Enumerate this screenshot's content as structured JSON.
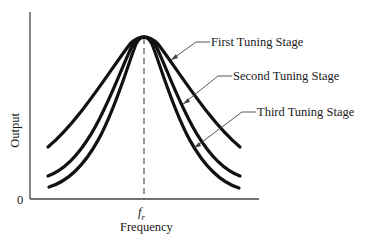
{
  "diagram": {
    "axes": {
      "y_label": "Output",
      "x_label": "Frequency",
      "origin_label": "0",
      "x_tick_label": "f",
      "x_tick_subscript": "r"
    },
    "curves": [
      {
        "label": "First Tuning Stage",
        "description": "widest response curve"
      },
      {
        "label": "Second Tuning Stage",
        "description": "middle response curve"
      },
      {
        "label": "Third Tuning Stage",
        "description": "narrowest response curve"
      }
    ],
    "colors": {
      "ink": "#1a1a1a",
      "leader": "#444444",
      "background": "#ffffff"
    }
  }
}
